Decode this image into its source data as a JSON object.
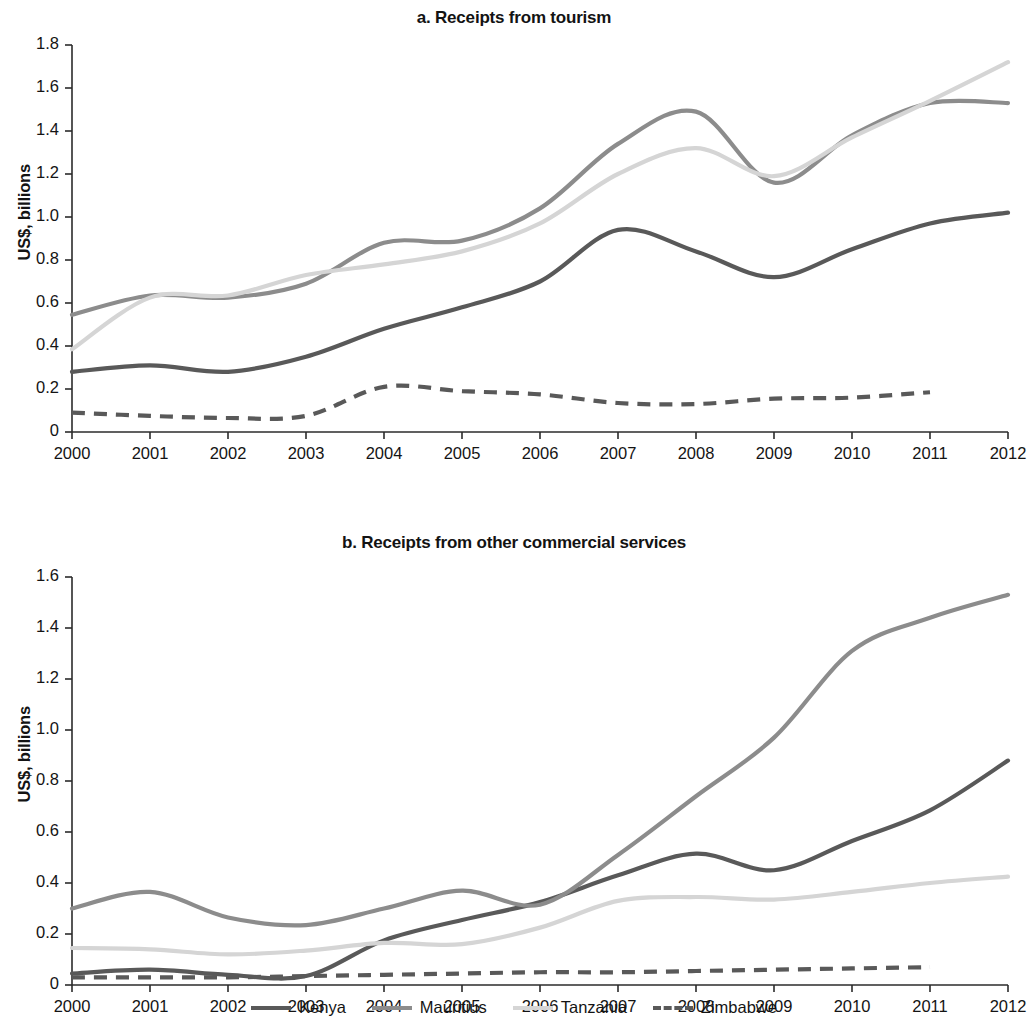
{
  "figure": {
    "y_axis_title": "US$, billions"
  },
  "legend": {
    "items": [
      {
        "label": "Kenya",
        "color": "#595959",
        "style": "solid",
        "icon": "line-swatch-icon"
      },
      {
        "label": "Mauritius",
        "color": "#8c8c8c",
        "style": "solid",
        "icon": "line-swatch-icon"
      },
      {
        "label": "Tanzania",
        "color": "#d5d5d5",
        "style": "solid",
        "icon": "line-swatch-icon"
      },
      {
        "label": "Zimbabwe",
        "color": "#595959",
        "style": "dashed",
        "icon": "dashed-line-swatch-icon"
      }
    ]
  },
  "chart_data": [
    {
      "type": "line",
      "id": "panel-a",
      "title": "a. Receipts from tourism",
      "xlabel": "",
      "ylabel": "US$, billions",
      "x": [
        2000,
        2001,
        2002,
        2003,
        2004,
        2005,
        2006,
        2007,
        2008,
        2009,
        2010,
        2011,
        2012
      ],
      "xtick_labels": [
        "2000",
        "2001",
        "2002",
        "2003",
        "2004",
        "2005",
        "2006",
        "2007",
        "2008",
        "2009",
        "2010",
        "2011",
        "2012"
      ],
      "ytick_labels": [
        "0",
        "0.2",
        "0.4",
        "0.6",
        "0.8",
        "1.0",
        "1.2",
        "1.4",
        "1.6",
        "1.8"
      ],
      "ytick_values": [
        0,
        0.2,
        0.4,
        0.6,
        0.8,
        1.0,
        1.2,
        1.4,
        1.6,
        1.8
      ],
      "xlim": [
        2000,
        2012
      ],
      "ylim": [
        0,
        1.8
      ],
      "grid": false,
      "legend_position": "below-figure",
      "series": [
        {
          "name": "Kenya",
          "color": "#595959",
          "style": "solid",
          "values": [
            0.28,
            0.31,
            0.28,
            0.35,
            0.48,
            0.58,
            0.7,
            0.94,
            0.84,
            0.72,
            0.85,
            0.97,
            1.02
          ]
        },
        {
          "name": "Mauritius",
          "color": "#8c8c8c",
          "style": "solid",
          "values": [
            0.545,
            0.635,
            0.625,
            0.69,
            0.88,
            0.89,
            1.04,
            1.34,
            1.49,
            1.16,
            1.38,
            1.53,
            1.53
          ]
        },
        {
          "name": "Tanzania",
          "color": "#d5d5d5",
          "style": "solid",
          "values": [
            0.385,
            0.625,
            0.635,
            0.73,
            0.78,
            0.84,
            0.97,
            1.2,
            1.32,
            1.19,
            1.37,
            1.54,
            1.72
          ]
        },
        {
          "name": "Zimbabwe",
          "color": "#595959",
          "style": "dashed",
          "values": [
            0.09,
            0.075,
            0.065,
            0.075,
            0.21,
            0.19,
            0.175,
            0.135,
            0.13,
            0.155,
            0.16,
            0.185,
            null
          ]
        }
      ]
    },
    {
      "type": "line",
      "id": "panel-b",
      "title": "b. Receipts from other commercial services",
      "xlabel": "",
      "ylabel": "US$, billions",
      "x": [
        2000,
        2001,
        2002,
        2003,
        2004,
        2005,
        2006,
        2007,
        2008,
        2009,
        2010,
        2011,
        2012
      ],
      "xtick_labels": [
        "2000",
        "2001",
        "2002",
        "2003",
        "2004",
        "2005",
        "2006",
        "2007",
        "2008",
        "2009",
        "2010",
        "2011",
        "2012"
      ],
      "ytick_labels": [
        "0",
        "0.2",
        "0.4",
        "0.6",
        "0.8",
        "1.0",
        "1.2",
        "1.4",
        "1.6"
      ],
      "ytick_values": [
        0,
        0.2,
        0.4,
        0.6,
        0.8,
        1.0,
        1.2,
        1.4,
        1.6
      ],
      "xlim": [
        2000,
        2012
      ],
      "ylim": [
        0,
        1.6
      ],
      "grid": false,
      "legend_position": "below-figure",
      "series": [
        {
          "name": "Kenya",
          "color": "#595959",
          "style": "solid",
          "values": [
            0.045,
            0.06,
            0.04,
            0.035,
            0.175,
            0.255,
            0.325,
            0.43,
            0.515,
            0.45,
            0.565,
            0.685,
            0.88
          ]
        },
        {
          "name": "Mauritius",
          "color": "#8c8c8c",
          "style": "solid",
          "values": [
            0.3,
            0.365,
            0.265,
            0.235,
            0.3,
            0.37,
            0.315,
            0.51,
            0.74,
            0.97,
            1.31,
            1.44,
            1.53
          ]
        },
        {
          "name": "Tanzania",
          "color": "#d5d5d5",
          "style": "solid",
          "values": [
            0.145,
            0.14,
            0.12,
            0.135,
            0.165,
            0.16,
            0.225,
            0.33,
            0.345,
            0.335,
            0.365,
            0.4,
            0.425
          ]
        },
        {
          "name": "Zimbabwe",
          "color": "#595959",
          "style": "dashed",
          "values": [
            0.03,
            0.03,
            0.03,
            0.035,
            0.04,
            0.045,
            0.05,
            0.05,
            0.055,
            0.06,
            0.065,
            0.07,
            null
          ]
        }
      ]
    }
  ]
}
